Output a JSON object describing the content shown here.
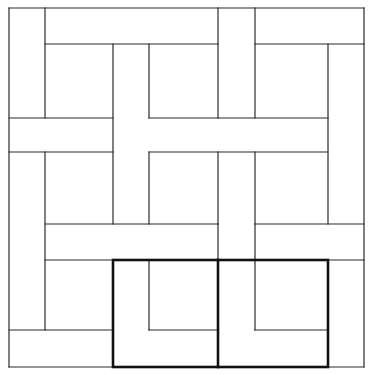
{
  "diagram": {
    "colors": {
      "background": "#ffffff",
      "line": "#2a2a2a",
      "highlight": "#111111"
    },
    "grid": {
      "x": [
        9,
        45,
        113,
        149,
        218,
        255,
        328,
        364
      ],
      "y": [
        8,
        44,
        118,
        152,
        224,
        260,
        330,
        367
      ]
    },
    "thin_lines": [
      [
        9,
        8,
        364,
        8
      ],
      [
        9,
        8,
        9,
        367
      ],
      [
        364,
        8,
        364,
        367
      ],
      [
        9,
        367,
        364,
        367
      ],
      [
        45,
        8,
        45,
        118
      ],
      [
        45,
        44,
        218,
        44
      ],
      [
        218,
        8,
        218,
        118
      ],
      [
        255,
        8,
        255,
        118
      ],
      [
        255,
        44,
        364,
        44
      ],
      [
        328,
        44,
        328,
        224
      ],
      [
        113,
        44,
        113,
        224
      ],
      [
        149,
        44,
        149,
        118
      ],
      [
        9,
        118,
        113,
        118
      ],
      [
        149,
        118,
        328,
        118
      ],
      [
        9,
        152,
        113,
        152
      ],
      [
        149,
        152,
        328,
        152
      ],
      [
        45,
        152,
        45,
        330
      ],
      [
        149,
        152,
        149,
        224
      ],
      [
        218,
        152,
        218,
        224
      ],
      [
        255,
        152,
        255,
        224
      ],
      [
        45,
        224,
        218,
        224
      ],
      [
        255,
        224,
        364,
        224
      ],
      [
        45,
        260,
        113,
        260
      ],
      [
        255,
        260,
        364,
        260
      ],
      [
        218,
        224,
        218,
        260
      ],
      [
        255,
        224,
        255,
        330
      ],
      [
        149,
        260,
        149,
        330
      ],
      [
        328,
        260,
        328,
        367
      ],
      [
        9,
        330,
        113,
        330
      ],
      [
        149,
        330,
        218,
        330
      ],
      [
        255,
        330,
        328,
        330
      ]
    ],
    "thick_rect": {
      "x": 113,
      "y": 260,
      "width": 215,
      "height": 107
    },
    "thick_lines": [
      [
        218,
        260,
        218,
        367
      ]
    ]
  }
}
